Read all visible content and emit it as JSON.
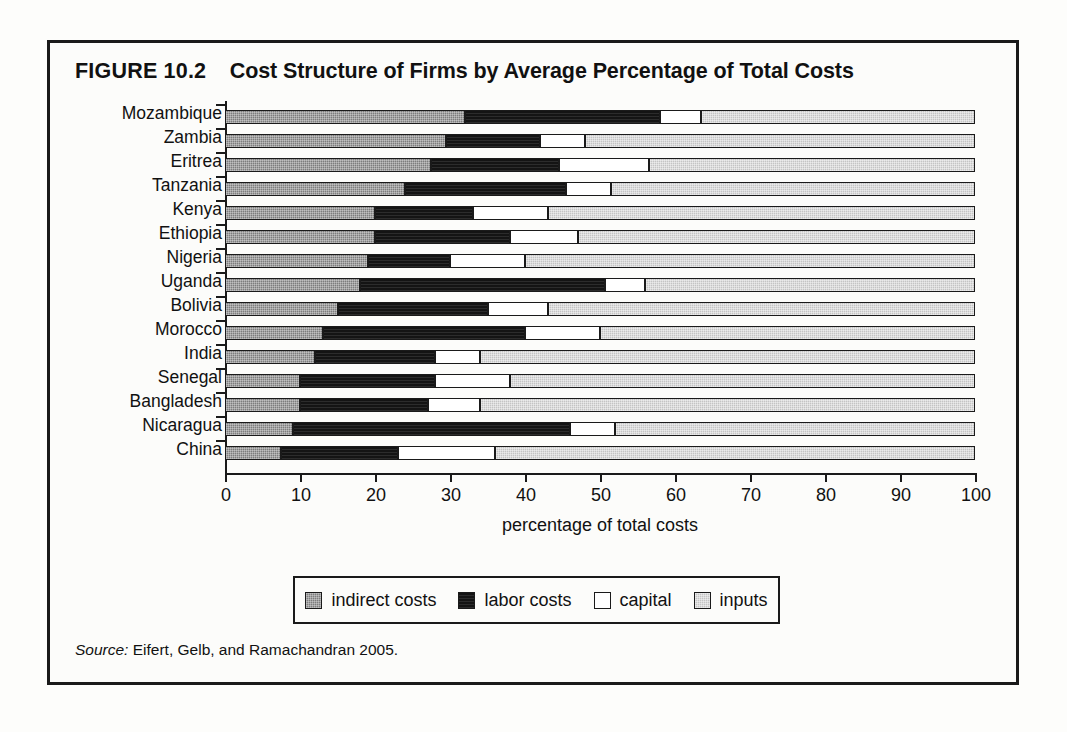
{
  "figure": {
    "number": "FIGURE 10.2",
    "title": "Cost Structure of Firms by Average Percentage of Total Costs",
    "source_word": "Source:",
    "source_text": " Eifert, Gelb, and Ramachandran 2005."
  },
  "legend": {
    "items": [
      {
        "label": "indirect costs",
        "key": "indirect",
        "color": "#7d7d7d"
      },
      {
        "label": "labor costs",
        "key": "labor",
        "color": "#141414"
      },
      {
        "label": "capital",
        "key": "capital",
        "color": "#ffffff"
      },
      {
        "label": "inputs",
        "key": "inputs",
        "color": "#c4c4c4"
      }
    ]
  },
  "chart_data": {
    "type": "bar",
    "orientation": "horizontal",
    "stacked": true,
    "stack_mode": "percent",
    "xlabel": "percentage of total costs",
    "ylabel": "",
    "xlim": [
      0,
      100
    ],
    "xticks": [
      0,
      10,
      20,
      30,
      40,
      50,
      60,
      70,
      80,
      90,
      100
    ],
    "xtick_labels": [
      "0",
      "10",
      "20",
      "30",
      "40",
      "50",
      "60",
      "70",
      "80",
      "90",
      "100"
    ],
    "grid": false,
    "legend_position": "bottom",
    "categories": [
      "Mozambique",
      "Zambia",
      "Eritrea",
      "Tanzania",
      "Kenya",
      "Ethiopia",
      "Nigeria",
      "Uganda",
      "Bolivia",
      "Morocco",
      "India",
      "Senegal",
      "Bangladesh",
      "Nicaragua",
      "China"
    ],
    "series": [
      {
        "name": "indirect costs",
        "values": [
          32.0,
          29.5,
          27.5,
          24.0,
          20.0,
          20.0,
          19.0,
          18.0,
          15.0,
          13.0,
          12.0,
          10.0,
          10.0,
          9.0,
          7.5
        ]
      },
      {
        "name": "labor costs",
        "values": [
          26.0,
          12.5,
          17.0,
          21.5,
          13.0,
          18.0,
          11.0,
          32.7,
          20.0,
          27.0,
          16.0,
          18.0,
          17.0,
          37.0,
          15.5
        ]
      },
      {
        "name": "capital",
        "values": [
          5.5,
          6.0,
          12.0,
          6.0,
          10.0,
          9.0,
          10.0,
          5.3,
          8.0,
          10.0,
          6.0,
          10.0,
          7.0,
          6.0,
          13.0
        ]
      },
      {
        "name": "inputs",
        "values": [
          36.5,
          52.0,
          43.5,
          48.5,
          57.0,
          53.0,
          60.0,
          44.0,
          57.0,
          50.0,
          66.0,
          62.0,
          66.0,
          48.0,
          64.0
        ]
      }
    ],
    "cumulative_boundaries": [
      {
        "category": "Mozambique",
        "indirect_end": 32.0,
        "labor_end": 58.0,
        "capital_end": 63.5,
        "inputs_end": 100
      },
      {
        "category": "Zambia",
        "indirect_end": 29.5,
        "labor_end": 42.0,
        "capital_end": 48.0,
        "inputs_end": 100
      },
      {
        "category": "Eritrea",
        "indirect_end": 27.5,
        "labor_end": 44.5,
        "capital_end": 56.5,
        "inputs_end": 100
      },
      {
        "category": "Tanzania",
        "indirect_end": 24.0,
        "labor_end": 45.5,
        "capital_end": 51.5,
        "inputs_end": 100
      },
      {
        "category": "Kenya",
        "indirect_end": 20.0,
        "labor_end": 33.0,
        "capital_end": 43.0,
        "inputs_end": 100
      },
      {
        "category": "Ethiopia",
        "indirect_end": 20.0,
        "labor_end": 38.0,
        "capital_end": 47.0,
        "inputs_end": 100
      },
      {
        "category": "Nigeria",
        "indirect_end": 19.0,
        "labor_end": 30.0,
        "capital_end": 40.0,
        "inputs_end": 100
      },
      {
        "category": "Uganda",
        "indirect_end": 18.0,
        "labor_end": 50.7,
        "capital_end": 56.0,
        "inputs_end": 100
      },
      {
        "category": "Bolivia",
        "indirect_end": 15.0,
        "labor_end": 35.0,
        "capital_end": 43.0,
        "inputs_end": 100
      },
      {
        "category": "Morocco",
        "indirect_end": 13.0,
        "labor_end": 40.0,
        "capital_end": 50.0,
        "inputs_end": 100
      },
      {
        "category": "India",
        "indirect_end": 12.0,
        "labor_end": 28.0,
        "capital_end": 34.0,
        "inputs_end": 100
      },
      {
        "category": "Senegal",
        "indirect_end": 10.0,
        "labor_end": 28.0,
        "capital_end": 38.0,
        "inputs_end": 100
      },
      {
        "category": "Bangladesh",
        "indirect_end": 10.0,
        "labor_end": 27.0,
        "capital_end": 34.0,
        "inputs_end": 100
      },
      {
        "category": "Nicaragua",
        "indirect_end": 9.0,
        "labor_end": 46.0,
        "capital_end": 52.0,
        "inputs_end": 100
      },
      {
        "category": "China",
        "indirect_end": 7.5,
        "labor_end": 23.0,
        "capital_end": 36.0,
        "inputs_end": 100
      }
    ]
  }
}
